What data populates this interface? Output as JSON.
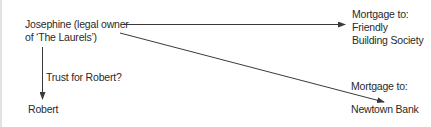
{
  "diagram": {
    "nodes": {
      "josephine": {
        "line1": "Josephine (legal owner",
        "line2": "of ‘The Laurels’)"
      },
      "robert": {
        "label": "Robert"
      },
      "friendly": {
        "line1": "Mortgage to:",
        "line2": "Friendly",
        "line3": "Building Society"
      },
      "newtown": {
        "line1": "Mortgage to:",
        "line2": "Newtown Bank"
      }
    },
    "edges": {
      "trust": {
        "label": "Trust for Robert?",
        "from": "josephine",
        "to": "robert"
      },
      "mortgage_friendly": {
        "from": "josephine",
        "to": "friendly"
      },
      "mortgage_newtown": {
        "from": "josephine",
        "to": "newtown"
      }
    },
    "colors": {
      "line": "#3a3a3a",
      "text": "#2a2a2a",
      "left_rule": "#e2e2e2"
    }
  }
}
